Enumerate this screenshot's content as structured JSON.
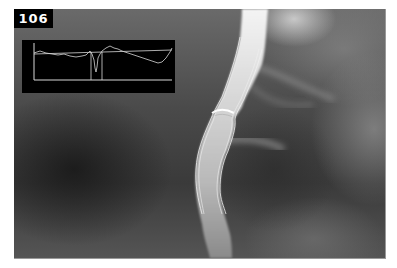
{
  "figure": {
    "number": "106"
  },
  "inset_chart": {
    "type": "line",
    "description": "Vessel diameter profile along segment with reference line and stenosis markers",
    "reference_line_y": 54,
    "marker_positions_x": [
      91,
      102
    ],
    "colors": {
      "background": "#000000",
      "line": "#d8d8d8"
    }
  },
  "image": {
    "description": "Grayscale angiogram showing a contrast-filled vessel with traced outline contours and a focal narrowing",
    "colors": {
      "contour": "#f0f0f0"
    }
  }
}
